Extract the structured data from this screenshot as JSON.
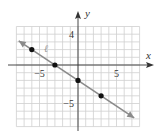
{
  "chart_data": {
    "type": "line",
    "title": "",
    "xlabel": "x",
    "ylabel": "y",
    "xlim": [
      -8,
      8
    ],
    "ylim": [
      -8,
      5
    ],
    "grid": true,
    "x_tick_labels": [
      {
        "value": -5,
        "text": "−5"
      },
      {
        "value": 5,
        "text": "5"
      }
    ],
    "y_tick_labels": [
      {
        "value": 4,
        "text": "4"
      },
      {
        "value": -5,
        "text": "−5"
      }
    ],
    "series": [
      {
        "name": "ℓ",
        "equation": "y = -2/3 x - 2",
        "slope": -0.6667,
        "intercept": -2,
        "line_extent_x": [
          -7.7,
          7.3
        ],
        "arrows": "both",
        "points": [
          {
            "x": -6,
            "y": 2
          },
          {
            "x": -3,
            "y": 0
          },
          {
            "x": 0,
            "y": -2
          },
          {
            "x": 3,
            "y": -4
          }
        ]
      }
    ],
    "colors": {
      "line": "#8a8a8a",
      "grid": "#cfcfcf",
      "axis": "#333333",
      "points": "#111111",
      "line_label": "#999999"
    }
  }
}
